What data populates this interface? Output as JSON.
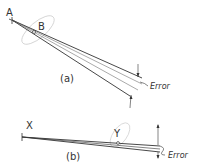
{
  "figure_a": {
    "caption": "(a)",
    "point_a_label": "A",
    "point_b_label": "B",
    "error_label": "Error"
  },
  "figure_b": {
    "caption": "(b)",
    "point_x_label": "X",
    "point_y_label": "Y",
    "error_label": "Error"
  },
  "colors": {
    "line": "#333333",
    "ellipse": "#cccccc"
  }
}
